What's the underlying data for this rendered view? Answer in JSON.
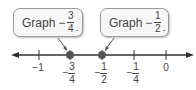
{
  "callouts": [
    {
      "text": "Graph",
      "sign": "−",
      "numerator": "3",
      "denominator": "4",
      "punct": "."
    },
    {
      "text": "Graph",
      "sign": "−",
      "numerator": "1",
      "denominator": "2",
      "punct": "."
    }
  ],
  "number_line": {
    "ticks": [
      {
        "label": "−1",
        "value": -1
      },
      {
        "sign": "−",
        "numerator": "3",
        "denominator": "4",
        "value": -0.75
      },
      {
        "sign": "−",
        "numerator": "1",
        "denominator": "2",
        "value": -0.5
      },
      {
        "sign": "−",
        "numerator": "1",
        "denominator": "4",
        "value": -0.25
      },
      {
        "label": "0",
        "value": 0
      }
    ],
    "points": [
      -0.75,
      -0.5
    ],
    "colors": {
      "line": "#333333",
      "point": "#555555"
    }
  }
}
